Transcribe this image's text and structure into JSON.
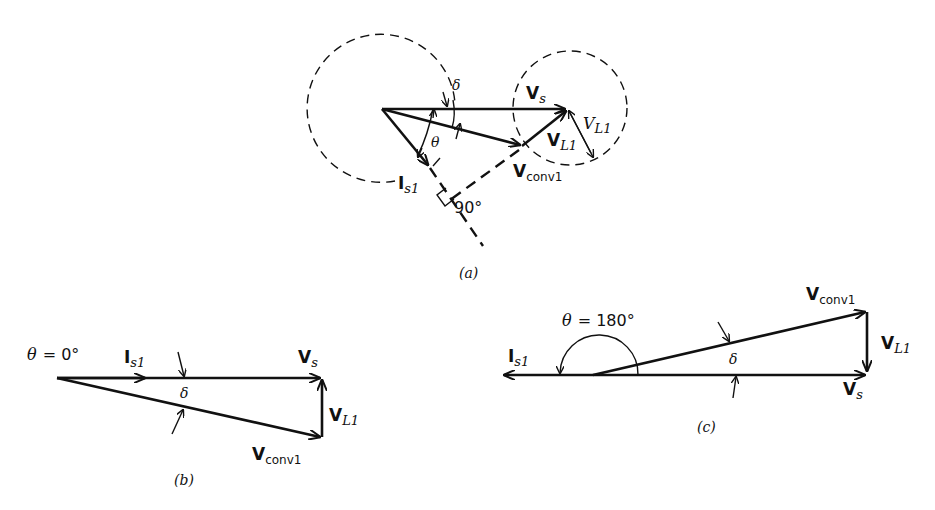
{
  "diagrams": {
    "a": {
      "caption": "(a)",
      "labels": {
        "vs_main": "V",
        "vs_sub": "s",
        "vl1_bold_main": "V",
        "vl1_bold_sub": "L1",
        "vl1_italic_main": "V",
        "vl1_italic_sub": "L1",
        "vconv_main": "V",
        "vconv_sub": "conv1",
        "is1_main": "I",
        "is1_sub": "s1",
        "delta": "δ",
        "theta": "θ",
        "right_angle": "90°"
      }
    },
    "b": {
      "caption": "(b)",
      "labels": {
        "theta_eq_sym": "θ",
        "theta_eq_val": "= 0°",
        "is1_main": "I",
        "is1_sub": "s1",
        "vs_main": "V",
        "vs_sub": "s",
        "vl1_main": "V",
        "vl1_sub": "L1",
        "vconv_main": "V",
        "vconv_sub": "conv1",
        "delta": "δ"
      }
    },
    "c": {
      "caption": "(c)",
      "labels": {
        "theta_eq_sym": "θ",
        "theta_eq_val": "= 180°",
        "is1_main": "I",
        "is1_sub": "s1",
        "vs_main": "V",
        "vs_sub": "s",
        "vl1_main": "V",
        "vl1_sub": "L1",
        "vconv_main": "V",
        "vconv_sub": "conv1",
        "delta": "δ"
      }
    }
  }
}
